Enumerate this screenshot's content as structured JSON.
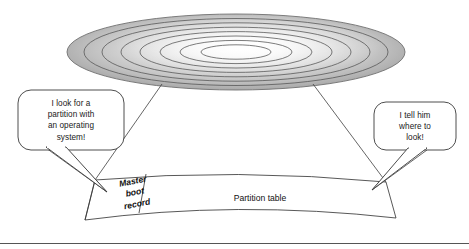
{
  "figure": {
    "type": "hard-disk-partition-diagram",
    "background_color": "#ffffff"
  },
  "disk": {
    "name": "hard-disk-platter",
    "track_count": 7,
    "edge_color": "#a6a6a6",
    "center_color": "#fbfbfb",
    "outline_color": "#6b6b6b",
    "track_line_color": "#4d4d4d"
  },
  "sector": {
    "name": "disk-sector-band",
    "fill_color": "#ffffff",
    "outline_color": "#3a3a3a",
    "segments": [
      {
        "id": "mbr",
        "label": "Master\nboot\nrecord",
        "label_line_1": "Master",
        "label_line_2": "boot",
        "label_line_3": "record"
      },
      {
        "id": "partition-table",
        "label": "Partition table"
      }
    ]
  },
  "callouts": [
    {
      "id": "left",
      "speaker": "operating-system-loader",
      "text": "I look for a partition with an operating system!",
      "lines": [
        "I look for a",
        "partition with",
        "an operating",
        "system!"
      ],
      "fill_color": "#ffffff",
      "border_color": "#3a3a3a"
    },
    {
      "id": "right",
      "speaker": "partition-table",
      "text": "I tell him where to look!",
      "lines": [
        "I tell him",
        "where to",
        "look!"
      ],
      "fill_color": "#ffffff",
      "border_color": "#3a3a3a"
    }
  ],
  "footer_rule": {
    "name": "bottom-divider",
    "color": "#555555"
  }
}
